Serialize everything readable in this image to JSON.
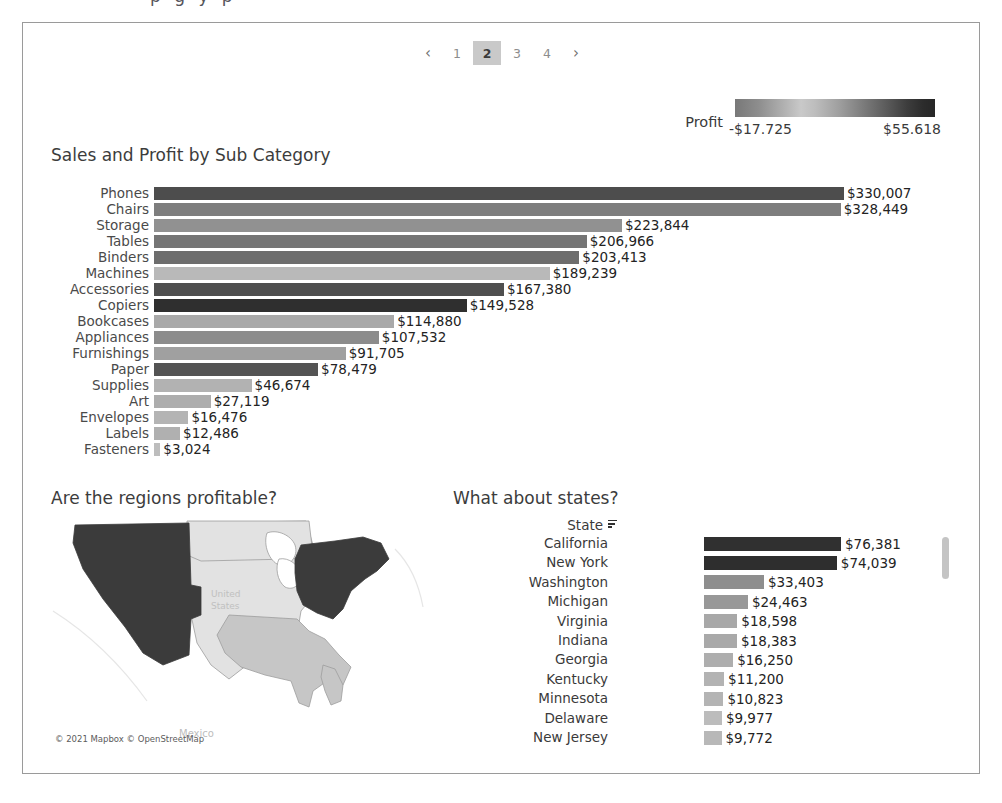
{
  "cutoff_text": "p   g   y p",
  "pagination": {
    "prev_icon": "chevron-left-icon",
    "prev_label": "‹",
    "next_icon": "chevron-right-icon",
    "next_label": "›",
    "pages": [
      "1",
      "2",
      "3",
      "4"
    ],
    "active_page": "2"
  },
  "legend": {
    "title": "Profit",
    "min_label": "-$17.725",
    "max_label": "$55.618"
  },
  "sections": {
    "subcategory_title": "Sales and Profit by Sub Category",
    "regions_title": "Are the regions profitable?",
    "states_title": "What about states?"
  },
  "map": {
    "attribution": "© 2021 Mapbox © OpenStreetMap",
    "label_us": "United States",
    "label_mexico": "Mexico",
    "regions": [
      {
        "name": "West",
        "color": "#3b3b3b"
      },
      {
        "name": "East",
        "color": "#3b3b3b"
      },
      {
        "name": "Central",
        "color": "#e2e2e2"
      },
      {
        "name": "South",
        "color": "#c6c6c6"
      }
    ]
  },
  "states_table": {
    "header": "State",
    "sort_icon": "sort-descending-icon",
    "scrollbar": "vertical-scrollbar"
  },
  "chart_data": [
    {
      "type": "bar",
      "title": "Sales and Profit by Sub Category",
      "orientation": "horizontal",
      "xlabel": "Sales",
      "ylabel": "Sub-Category",
      "grid": false,
      "legend": "Profit (color)",
      "xlim": [
        0,
        330007
      ],
      "categories": [
        "Phones",
        "Chairs",
        "Storage",
        "Tables",
        "Binders",
        "Machines",
        "Accessories",
        "Copiers",
        "Bookcases",
        "Appliances",
        "Furnishings",
        "Paper",
        "Supplies",
        "Art",
        "Envelopes",
        "Labels",
        "Fasteners"
      ],
      "values": [
        330007,
        328449,
        223844,
        206966,
        203413,
        189239,
        167380,
        149528,
        114880,
        107532,
        91705,
        78479,
        46674,
        27119,
        16476,
        12486,
        3024
      ],
      "value_labels": [
        "$330,007",
        "$328,449",
        "$223,844",
        "$206,966",
        "$203,413",
        "$189,239",
        "$167,380",
        "$149,528",
        "$114,880",
        "$107,532",
        "$91,705",
        "$78,479",
        "$46,674",
        "$27,119",
        "$16,476",
        "$12,486",
        "$3,024"
      ],
      "colors": [
        "#4d4d4d",
        "#7e7e7e",
        "#919191",
        "#757575",
        "#6d6d6d",
        "#b9b9b9",
        "#4f4f4f",
        "#2f2f2f",
        "#a9a9a9",
        "#8c8c8c",
        "#a0a0a0",
        "#545454",
        "#b2b2b2",
        "#adadad",
        "#b4b4b4",
        "#b0b0b0",
        "#bdbdbd"
      ]
    },
    {
      "type": "bar",
      "title": "What about states?",
      "orientation": "horizontal",
      "xlabel": "Sales",
      "ylabel": "State",
      "grid": false,
      "xlim": [
        0,
        76381
      ],
      "categories": [
        "California",
        "New York",
        "Washington",
        "Michigan",
        "Virginia",
        "Indiana",
        "Georgia",
        "Kentucky",
        "Minnesota",
        "Delaware",
        "New Jersey"
      ],
      "values": [
        76381,
        74039,
        33403,
        24463,
        18598,
        18383,
        16250,
        11200,
        10823,
        9977,
        9772
      ],
      "value_labels": [
        "$76,381",
        "$74,039",
        "$33,403",
        "$24,463",
        "$18,598",
        "$18,383",
        "$16,250",
        "$11,200",
        "$10,823",
        "$9,977",
        "$9,772"
      ],
      "colors": [
        "#303030",
        "#2e2e2e",
        "#8e8e8e",
        "#989898",
        "#a8a8a8",
        "#a9a9a9",
        "#aeaeae",
        "#b3b3b3",
        "#b4b4b4",
        "#bcbcbc",
        "#b8b8b8"
      ]
    },
    {
      "type": "heatmap",
      "title": "Are the regions profitable?",
      "map": "choropleth-us-regions",
      "categories": [
        "West",
        "East",
        "Central",
        "South"
      ],
      "colors": [
        "#3b3b3b",
        "#3b3b3b",
        "#e2e2e2",
        "#c6c6c6"
      ]
    }
  ]
}
